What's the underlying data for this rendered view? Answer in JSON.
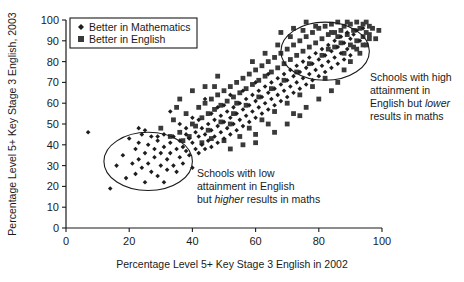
{
  "chart_data": {
    "type": "scatter",
    "title": "",
    "xlabel": "Percentage Level 5+ Key Stage 3 English in 2002",
    "ylabel": "Percentage Level 5+ Key Stage 3 English, 2003",
    "xlim": [
      0,
      100
    ],
    "ylim": [
      0,
      100
    ],
    "xticks": [
      0,
      20,
      40,
      60,
      80,
      100
    ],
    "yticks": [
      0,
      10,
      20,
      30,
      40,
      50,
      60,
      70,
      80,
      90,
      100
    ],
    "grid": false,
    "legend_position": "top-left",
    "series": [
      {
        "name": "Better in Mathematics",
        "marker": "diamond",
        "color": "#1d1d1d",
        "points": [
          [
            7,
            46
          ],
          [
            14,
            19
          ],
          [
            16,
            30
          ],
          [
            18,
            35
          ],
          [
            19,
            24
          ],
          [
            20,
            43
          ],
          [
            21,
            31
          ],
          [
            22,
            38
          ],
          [
            22,
            26
          ],
          [
            23,
            41
          ],
          [
            23,
            33
          ],
          [
            24,
            29
          ],
          [
            24,
            45
          ],
          [
            25,
            36
          ],
          [
            25,
            22
          ],
          [
            26,
            40
          ],
          [
            26,
            31
          ],
          [
            27,
            27
          ],
          [
            27,
            44
          ],
          [
            28,
            38
          ],
          [
            28,
            34
          ],
          [
            29,
            25
          ],
          [
            29,
            42
          ],
          [
            30,
            36
          ],
          [
            30,
            30
          ],
          [
            31,
            45
          ],
          [
            31,
            39
          ],
          [
            31,
            22
          ],
          [
            32,
            33
          ],
          [
            32,
            28
          ],
          [
            33,
            41
          ],
          [
            33,
            36
          ],
          [
            34,
            30
          ],
          [
            34,
            44
          ],
          [
            35,
            38
          ],
          [
            35,
            27
          ],
          [
            36,
            42
          ],
          [
            36,
            34
          ],
          [
            37,
            39
          ],
          [
            37,
            31
          ],
          [
            38,
            45
          ],
          [
            38,
            37
          ],
          [
            39,
            43
          ],
          [
            39,
            35
          ],
          [
            40,
            41
          ],
          [
            40,
            29
          ],
          [
            41,
            46
          ],
          [
            41,
            38
          ],
          [
            33,
            56
          ],
          [
            29,
            44
          ],
          [
            25,
            47
          ],
          [
            23,
            48
          ],
          [
            42,
            44
          ],
          [
            42,
            36
          ],
          [
            43,
            48
          ],
          [
            43,
            40
          ],
          [
            44,
            45
          ],
          [
            44,
            38
          ],
          [
            45,
            50
          ],
          [
            45,
            42
          ],
          [
            46,
            47
          ],
          [
            46,
            39
          ],
          [
            47,
            52
          ],
          [
            47,
            44
          ],
          [
            48,
            49
          ],
          [
            48,
            41
          ],
          [
            49,
            54
          ],
          [
            49,
            46
          ],
          [
            50,
            51
          ],
          [
            50,
            43
          ],
          [
            51,
            56
          ],
          [
            51,
            48
          ],
          [
            52,
            53
          ],
          [
            52,
            45
          ],
          [
            53,
            58
          ],
          [
            53,
            50
          ],
          [
            54,
            55
          ],
          [
            54,
            47
          ],
          [
            55,
            60
          ],
          [
            55,
            52
          ],
          [
            56,
            57
          ],
          [
            56,
            49
          ],
          [
            57,
            62
          ],
          [
            57,
            54
          ],
          [
            58,
            59
          ],
          [
            58,
            51
          ],
          [
            59,
            64
          ],
          [
            59,
            56
          ],
          [
            60,
            61
          ],
          [
            60,
            53
          ],
          [
            61,
            66
          ],
          [
            61,
            58
          ],
          [
            62,
            63
          ],
          [
            62,
            55
          ],
          [
            63,
            68
          ],
          [
            63,
            60
          ],
          [
            64,
            65
          ],
          [
            64,
            57
          ],
          [
            65,
            70
          ],
          [
            65,
            62
          ],
          [
            66,
            67
          ],
          [
            66,
            59
          ],
          [
            67,
            72
          ],
          [
            67,
            64
          ],
          [
            68,
            69
          ],
          [
            68,
            61
          ],
          [
            69,
            74
          ],
          [
            69,
            66
          ],
          [
            70,
            71
          ],
          [
            70,
            63
          ],
          [
            71,
            76
          ],
          [
            71,
            68
          ],
          [
            72,
            73
          ],
          [
            72,
            65
          ],
          [
            73,
            78
          ],
          [
            73,
            70
          ],
          [
            74,
            75
          ],
          [
            74,
            67
          ],
          [
            75,
            80
          ],
          [
            75,
            72
          ],
          [
            76,
            77
          ],
          [
            76,
            69
          ],
          [
            77,
            82
          ],
          [
            77,
            74
          ],
          [
            78,
            79
          ],
          [
            78,
            71
          ],
          [
            79,
            84
          ],
          [
            79,
            76
          ],
          [
            80,
            81
          ],
          [
            80,
            73
          ],
          [
            81,
            86
          ],
          [
            81,
            78
          ],
          [
            82,
            83
          ],
          [
            82,
            75
          ],
          [
            83,
            88
          ],
          [
            83,
            80
          ],
          [
            84,
            85
          ],
          [
            84,
            77
          ],
          [
            85,
            90
          ],
          [
            85,
            82
          ],
          [
            86,
            87
          ],
          [
            86,
            79
          ],
          [
            87,
            92
          ],
          [
            87,
            84
          ],
          [
            88,
            89
          ],
          [
            88,
            81
          ],
          [
            89,
            94
          ],
          [
            89,
            86
          ],
          [
            90,
            91
          ],
          [
            90,
            83
          ],
          [
            91,
            93
          ],
          [
            92,
            95
          ],
          [
            93,
            90
          ],
          [
            94,
            96
          ],
          [
            44,
            62
          ],
          [
            48,
            58
          ],
          [
            52,
            64
          ],
          [
            56,
            66
          ],
          [
            60,
            70
          ],
          [
            64,
            74
          ],
          [
            42,
            52
          ],
          [
            46,
            55
          ],
          [
            50,
            59
          ],
          [
            38,
            48
          ],
          [
            36,
            50
          ],
          [
            40,
            53
          ]
        ]
      },
      {
        "name": "Better in English",
        "marker": "square",
        "color": "#3a3a3a",
        "points": [
          [
            30,
            48
          ],
          [
            34,
            52
          ],
          [
            36,
            46
          ],
          [
            38,
            55
          ],
          [
            40,
            50
          ],
          [
            42,
            58
          ],
          [
            43,
            53
          ],
          [
            44,
            60
          ],
          [
            45,
            55
          ],
          [
            46,
            62
          ],
          [
            47,
            57
          ],
          [
            48,
            64
          ],
          [
            49,
            59
          ],
          [
            50,
            66
          ],
          [
            51,
            61
          ],
          [
            52,
            68
          ],
          [
            53,
            63
          ],
          [
            54,
            70
          ],
          [
            55,
            65
          ],
          [
            56,
            72
          ],
          [
            57,
            67
          ],
          [
            58,
            74
          ],
          [
            59,
            69
          ],
          [
            60,
            76
          ],
          [
            61,
            71
          ],
          [
            62,
            78
          ],
          [
            63,
            73
          ],
          [
            64,
            80
          ],
          [
            65,
            75
          ],
          [
            66,
            82
          ],
          [
            67,
            77
          ],
          [
            68,
            84
          ],
          [
            69,
            79
          ],
          [
            70,
            86
          ],
          [
            71,
            81
          ],
          [
            72,
            88
          ],
          [
            73,
            83
          ],
          [
            74,
            90
          ],
          [
            75,
            85
          ],
          [
            76,
            92
          ],
          [
            77,
            87
          ],
          [
            78,
            94
          ],
          [
            79,
            89
          ],
          [
            80,
            96
          ],
          [
            81,
            91
          ],
          [
            82,
            97
          ],
          [
            83,
            93
          ],
          [
            84,
            98
          ],
          [
            85,
            94
          ],
          [
            86,
            99
          ],
          [
            87,
            95
          ],
          [
            88,
            97
          ],
          [
            89,
            93
          ],
          [
            90,
            98
          ],
          [
            91,
            95
          ],
          [
            92,
            99
          ],
          [
            93,
            96
          ],
          [
            94,
            98
          ],
          [
            95,
            94
          ],
          [
            96,
            97
          ],
          [
            41,
            49
          ],
          [
            45,
            47
          ],
          [
            49,
            51
          ],
          [
            53,
            55
          ],
          [
            57,
            59
          ],
          [
            61,
            63
          ],
          [
            65,
            67
          ],
          [
            69,
            71
          ],
          [
            73,
            75
          ],
          [
            77,
            79
          ],
          [
            81,
            83
          ],
          [
            85,
            87
          ],
          [
            88,
            76
          ],
          [
            90,
            88
          ],
          [
            92,
            90
          ],
          [
            94,
            92
          ],
          [
            95,
            88
          ],
          [
            96,
            91
          ],
          [
            62,
            52
          ],
          [
            66,
            56
          ],
          [
            70,
            60
          ],
          [
            74,
            64
          ],
          [
            78,
            68
          ],
          [
            82,
            72
          ],
          [
            60,
            45
          ],
          [
            64,
            50
          ],
          [
            55,
            44
          ],
          [
            50,
            42
          ],
          [
            46,
            43
          ],
          [
            72,
            55
          ],
          [
            76,
            58
          ],
          [
            80,
            62
          ],
          [
            84,
            66
          ],
          [
            86,
            70
          ],
          [
            88,
            84
          ],
          [
            90,
            80
          ],
          [
            33,
            44
          ],
          [
            37,
            42
          ],
          [
            35,
            58
          ],
          [
            39,
            44
          ],
          [
            43,
            41
          ],
          [
            47,
            68
          ],
          [
            58,
            48
          ],
          [
            54,
            60
          ],
          [
            52,
            50
          ],
          [
            59,
            80
          ],
          [
            63,
            84
          ],
          [
            67,
            88
          ],
          [
            71,
            92
          ],
          [
            75,
            95
          ],
          [
            79,
            97
          ],
          [
            83,
            86
          ],
          [
            87,
            89
          ],
          [
            91,
            87
          ],
          [
            93,
            84
          ],
          [
            95,
            99
          ],
          [
            48,
            73
          ],
          [
            44,
            68
          ],
          [
            40,
            66
          ],
          [
            36,
            62
          ],
          [
            68,
            94
          ],
          [
            72,
            96
          ],
          [
            76,
            99
          ],
          [
            84,
            94
          ],
          [
            86,
            92
          ],
          [
            89,
            99
          ],
          [
            92,
            86
          ],
          [
            94,
            88
          ],
          [
            96,
            93
          ],
          [
            97,
            96
          ],
          [
            98,
            91
          ],
          [
            99,
            95
          ],
          [
            66,
            46
          ],
          [
            70,
            50
          ],
          [
            74,
            54
          ],
          [
            56,
            40
          ],
          [
            52,
            38
          ],
          [
            60,
            41
          ]
        ]
      }
    ],
    "legend": [
      {
        "label": "Better in Mathematics",
        "marker": "diamond"
      },
      {
        "label": "Better in English",
        "marker": "square"
      }
    ],
    "annotations": [
      {
        "id": "high-english-lower-maths",
        "lines": [
          [
            {
              "t": "Schools with high",
              "em": false
            }
          ],
          [
            {
              "t": "attainment in",
              "em": false
            }
          ],
          [
            {
              "t": "English but ",
              "em": false
            },
            {
              "t": "lower",
              "em": true
            }
          ],
          [
            {
              "t": "results in maths",
              "em": false
            }
          ]
        ]
      },
      {
        "id": "low-english-higher-maths",
        "lines": [
          [
            {
              "t": "Schools with low",
              "em": false
            }
          ],
          [
            {
              "t": "attainment in English",
              "em": false
            }
          ],
          [
            {
              "t": "but ",
              "em": false
            },
            {
              "t": "higher",
              "em": true
            },
            {
              "t": " results in maths",
              "em": false
            }
          ]
        ]
      }
    ],
    "highlight_ellipses": [
      {
        "id": "upper-right-cluster",
        "cx": 82,
        "cy": 85,
        "rx": 14,
        "ry": 14
      },
      {
        "id": "lower-left-cluster",
        "cx": 26,
        "cy": 32,
        "rx": 14,
        "ry": 14
      }
    ]
  },
  "colors": {
    "axis": "#1a1a1a",
    "math_marker": "#1d1d1d",
    "english_marker": "#3a3a3a",
    "background": "#ffffff"
  }
}
